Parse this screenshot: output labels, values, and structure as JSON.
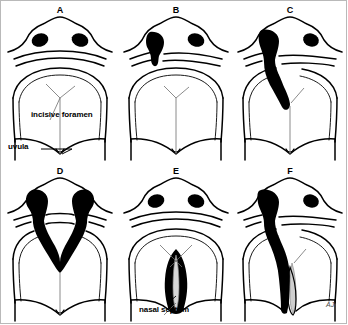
{
  "figure": {
    "signature": "AJ",
    "ink_color": "#000000",
    "septum_color": "#b0b0b0",
    "background": "#ffffff"
  },
  "annotations": [
    {
      "id": "incisive-foramen",
      "label": "incisive foramen",
      "panel": "A"
    },
    {
      "id": "uvula",
      "label": "uvula",
      "panel": "A"
    },
    {
      "id": "nasal-septum",
      "label": "nasal septum",
      "panel": "E"
    }
  ],
  "panels": [
    {
      "letter": "A",
      "name": "normal-palate",
      "description": "Normal lip and palate",
      "cleft_lip": "none",
      "cleft_palate": "none",
      "side": "none"
    },
    {
      "letter": "B",
      "name": "unilateral-cleft-lip",
      "description": "Unilateral cleft of the lip",
      "cleft_lip": "partial",
      "cleft_palate": "none",
      "side": "left"
    },
    {
      "letter": "C",
      "name": "unilateral-cleft-lip-and-alveolus",
      "description": "Unilateral cleft of the lip and alveolus to the incisive foramen",
      "cleft_lip": "complete",
      "cleft_palate": "primary",
      "side": "left"
    },
    {
      "letter": "D",
      "name": "bilateral-cleft-lip-and-alveolus",
      "description": "Bilateral cleft of the lip and alveolus",
      "cleft_lip": "complete",
      "cleft_palate": "primary",
      "side": "bilateral"
    },
    {
      "letter": "E",
      "name": "isolated-cleft-palate",
      "description": "Isolated cleft of the secondary palate showing the nasal septum",
      "cleft_lip": "none",
      "cleft_palate": "secondary",
      "side": "midline"
    },
    {
      "letter": "F",
      "name": "complete-unilateral-cleft-lip-and-palate",
      "description": "Complete unilateral cleft of the lip, alveolus and secondary palate",
      "cleft_lip": "complete",
      "cleft_palate": "primary-and-secondary",
      "side": "left"
    }
  ]
}
